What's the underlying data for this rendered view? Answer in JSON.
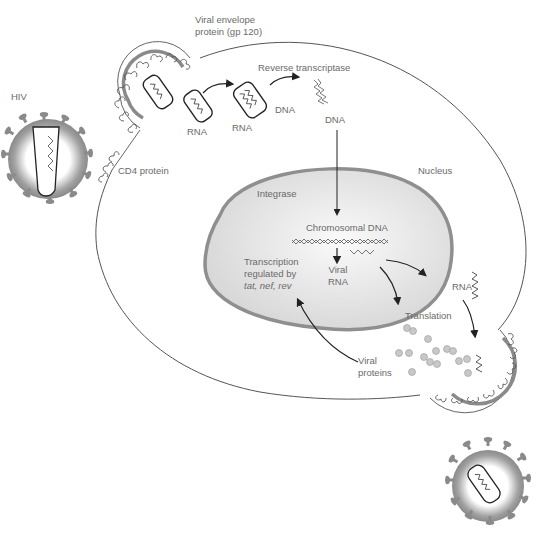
{
  "diagram": {
    "colors": {
      "membrane": "#555555",
      "virus_capsule": "#8a8a8a",
      "nucleus_rim": "#8f8f8f",
      "nucleus_fill": "#e4e4e4",
      "text": "#6a6a6a",
      "protein_dots": "#c8c8c8"
    },
    "labels": {
      "hiv": "HIV",
      "viral_envelope_line1": "Viral envelope",
      "viral_envelope_line2": "protein (gp 120)",
      "cd4": "CD4 protein",
      "rna1": "RNA",
      "rna2": "RNA",
      "dna_hybrid": "DNA",
      "reverse_transcriptase": "Reverse transcriptase",
      "dna": "DNA",
      "nucleus": "Nucleus",
      "integrase": "Integrase",
      "chromosomal_dna": "Chromosomal DNA",
      "viral_rna_line1": "Viral",
      "viral_rna_line2": "RNA",
      "transcription_line1": "Transcription",
      "transcription_line2": "regulated by",
      "transcription_line3": "tat, nef, rev",
      "rna_cyto": "RNA",
      "translation": "Translation",
      "viral_proteins_line1": "Viral",
      "viral_proteins_line2": "proteins"
    }
  }
}
